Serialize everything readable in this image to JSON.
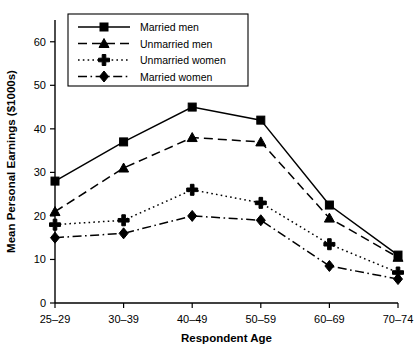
{
  "chart_data": {
    "type": "line",
    "title": "",
    "xlabel": "Respondent Age",
    "ylabel": "Mean Personal Earnings ($1000s)",
    "categories": [
      "25–29",
      "30–39",
      "40–49",
      "50–59",
      "60–69",
      "70–74"
    ],
    "ylim": [
      0,
      65
    ],
    "yticks": [
      0,
      10,
      20,
      30,
      40,
      50,
      60
    ],
    "ytick_labels": [
      "0",
      "10",
      "20",
      "30",
      "40",
      "50",
      "60"
    ],
    "grid": false,
    "legend_position": "top-left",
    "series": [
      {
        "name": "Married men",
        "marker": "square",
        "linestyle": "solid",
        "values": [
          28,
          37,
          45,
          42,
          22.5,
          11
        ]
      },
      {
        "name": "Unmarried men",
        "marker": "triangle",
        "linestyle": "dashed",
        "values": [
          21,
          31,
          38,
          37,
          19.5,
          10.5
        ]
      },
      {
        "name": "Unmarried women",
        "marker": "plus",
        "linestyle": "dotted",
        "values": [
          18,
          19,
          26,
          23,
          13.5,
          7
        ]
      },
      {
        "name": "Married women",
        "marker": "diamond",
        "linestyle": "dashdot",
        "values": [
          15,
          16,
          20,
          19,
          8.5,
          5.5
        ]
      }
    ]
  },
  "colors": {
    "ink": "#000000",
    "background": "#ffffff"
  }
}
